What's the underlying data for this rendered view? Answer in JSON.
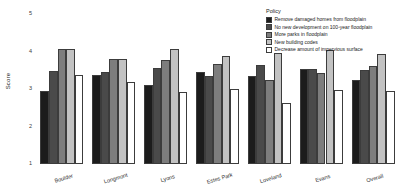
{
  "chart_data": {
    "type": "bar",
    "title": "",
    "subtitle": "",
    "xlabel": "",
    "ylabel": "Score",
    "ylim": [
      1,
      5
    ],
    "yticks": [
      1,
      2,
      3,
      4,
      5
    ],
    "ytick_labels": [
      "1",
      "2",
      "3",
      "4",
      "5"
    ],
    "grid": false,
    "legend_position": "top-right",
    "legend_title": "Policy",
    "categories": [
      "Boulder",
      "Longmont",
      "Lyons",
      "Estes Park",
      "Loveland",
      "Evans",
      "Overall"
    ],
    "series": [
      {
        "name": "Remove damaged homes from floodplain",
        "color": "#1c1c1c",
        "values": [
          2.95,
          3.38,
          3.1,
          3.46,
          3.35,
          3.53,
          3.23
        ]
      },
      {
        "name": "No new development on 100-year floodplain",
        "color": "#4a4a4a",
        "values": [
          3.48,
          3.46,
          3.57,
          3.36,
          3.64,
          3.53,
          3.5
        ]
      },
      {
        "name": "More parks in floodplain",
        "color": "#7d7d7d",
        "values": [
          4.07,
          3.8,
          3.78,
          3.66,
          3.23,
          3.42,
          3.62
        ]
      },
      {
        "name": "New building codes",
        "color": "#c2c2c2",
        "values": [
          4.07,
          3.79,
          4.06,
          3.89,
          3.96,
          4.03,
          3.93
        ]
      },
      {
        "name": "Decrease amount of impervious surface",
        "color": "#ffffff",
        "values": [
          3.37,
          3.18,
          2.93,
          2.99,
          2.62,
          2.97,
          2.95
        ]
      }
    ]
  },
  "axis": {
    "y_title": "Score"
  }
}
